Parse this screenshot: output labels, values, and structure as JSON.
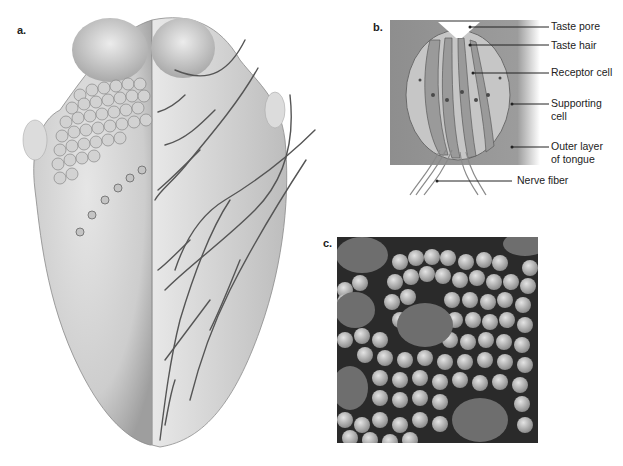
{
  "panels": {
    "a": {
      "label": "a.",
      "subject": "tongue-surface-with-nerve-branching"
    },
    "b": {
      "label": "b.",
      "subject": "taste-bud-cross-section",
      "callouts": [
        {
          "id": "taste-pore",
          "text": "Taste pore"
        },
        {
          "id": "taste-hair",
          "text": "Taste hair"
        },
        {
          "id": "receptor-cell",
          "text": "Receptor cell"
        },
        {
          "id": "supporting-cell",
          "line1": "Supporting",
          "line2": "cell"
        },
        {
          "id": "outer-layer",
          "line1": "Outer layer",
          "line2": "of tongue"
        },
        {
          "id": "nerve-fiber",
          "text": "Nerve fiber"
        }
      ]
    },
    "c": {
      "label": "c.",
      "subject": "micrograph-of-papillae"
    }
  },
  "colors": {
    "background": "#ffffff",
    "tongue_base": "#c9c9c9",
    "tongue_light": "#e2e2e2",
    "nerve": "#555555",
    "text": "#222222",
    "micrograph_bg": "#2a2a2a",
    "micrograph_papilla": "#bdbdbd"
  }
}
